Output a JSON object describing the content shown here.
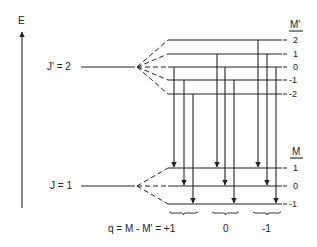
{
  "axis": {
    "label": "E"
  },
  "upper_level": {
    "label": "J' = 2",
    "header": "M'",
    "sublevels": [
      "2",
      "1",
      "0",
      "-1",
      "-2"
    ],
    "sublevel_values": [
      2,
      1,
      0,
      -1,
      -2
    ]
  },
  "lower_level": {
    "label": "J = 1",
    "header": "M",
    "sublevels": [
      "1",
      "0",
      "-1"
    ],
    "sublevel_values": [
      1,
      0,
      -1
    ]
  },
  "transition_groups": [
    {
      "q_label": "q = M - M' = +1",
      "q": 1,
      "transitions": [
        {
          "from_M_prime": 0,
          "to_M": 1
        },
        {
          "from_M_prime": -1,
          "to_M": 0
        },
        {
          "from_M_prime": -2,
          "to_M": -1
        }
      ]
    },
    {
      "q_label": "0",
      "q": 0,
      "transitions": [
        {
          "from_M_prime": 1,
          "to_M": 1
        },
        {
          "from_M_prime": 0,
          "to_M": 0
        },
        {
          "from_M_prime": -1,
          "to_M": -1
        }
      ]
    },
    {
      "q_label": "-1",
      "q": -1,
      "transitions": [
        {
          "from_M_prime": 2,
          "to_M": 1
        },
        {
          "from_M_prime": 1,
          "to_M": 0
        },
        {
          "from_M_prime": 0,
          "to_M": -1
        }
      ]
    }
  ],
  "colors": {
    "ink": "#222222",
    "background": "#ffffff"
  }
}
